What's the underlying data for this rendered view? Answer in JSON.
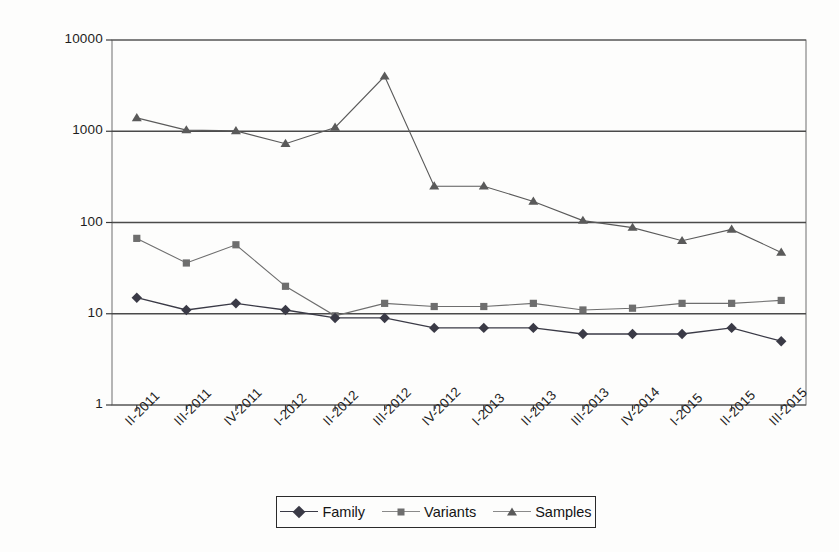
{
  "chart_data": {
    "type": "line",
    "title": "",
    "subtitle": "",
    "xlabel": "",
    "ylabel": "",
    "yscale": "log",
    "ylim": [
      1,
      10000
    ],
    "ytick_labels": [
      "10000",
      "1000",
      "100",
      "10",
      "1"
    ],
    "ytick_values": [
      10000,
      1000,
      100,
      10,
      1
    ],
    "grid": "horizontal",
    "legend_position": "bottom-center",
    "categories": [
      "II-2011",
      "III-2011",
      "IV-2011",
      "I-2012",
      "II-2012",
      "III-2012",
      "IV-2012",
      "I-2013",
      "II-2013",
      "III-2013",
      "IV-2014",
      "I-2015",
      "II-2015",
      "III-2015"
    ],
    "series": [
      {
        "name": "Family",
        "marker": "diamond",
        "color": "#3a3a46",
        "values": [
          15,
          11,
          13,
          11,
          9,
          9,
          7,
          7,
          7,
          6,
          6,
          6,
          7,
          5
        ]
      },
      {
        "name": "Variants",
        "marker": "square",
        "color": "#6e6e6e",
        "values": [
          67,
          36,
          57,
          20,
          9.5,
          13,
          12,
          12,
          13,
          11,
          11.5,
          13,
          13,
          14
        ]
      },
      {
        "name": "Samples",
        "marker": "triangle",
        "color": "#5a5a5a",
        "values": [
          1400,
          1030,
          1010,
          730,
          1100,
          4000,
          250,
          250,
          170,
          105,
          88,
          63,
          84,
          47
        ]
      }
    ]
  },
  "legend": {
    "items": [
      {
        "label": "Family",
        "icon": "diamond-marker-icon"
      },
      {
        "label": "Variants",
        "icon": "square-marker-icon"
      },
      {
        "label": "Samples",
        "icon": "triangle-marker-icon"
      }
    ]
  }
}
